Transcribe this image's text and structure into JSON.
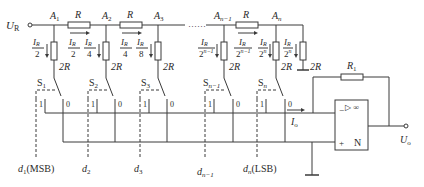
{
  "diagram": {
    "type": "R-2R ladder D/A converter",
    "reference_voltage_label": "U",
    "reference_voltage_sub": "R",
    "output_voltage_label": "U",
    "output_voltage_sub": "o",
    "output_current_label": "I",
    "output_current_sub": "o",
    "ellipsis": "……",
    "nodes": [
      {
        "label": "A",
        "sub": "1"
      },
      {
        "label": "A",
        "sub": "2"
      },
      {
        "label": "A",
        "sub": "3"
      },
      {
        "label": "A",
        "sub": "n−1"
      },
      {
        "label": "A",
        "sub": "n"
      }
    ],
    "series_resistor_label": "R",
    "shunt_resistor_label": "2R",
    "feedback_resistor_label": "R",
    "feedback_resistor_sub": "1",
    "branch_currents": [
      {
        "num": "I",
        "num_sub": "R",
        "den": "2"
      },
      {
        "num": "I",
        "num_sub": "R",
        "den": "4"
      },
      {
        "num": "I",
        "num_sub": "R",
        "den": "8"
      },
      {
        "num": "I",
        "num_sub": "R",
        "den": "2",
        "den_sup": "n−1"
      },
      {
        "num": "I",
        "num_sub": "R",
        "den": "2",
        "den_sup": "n"
      },
      {
        "num": "I",
        "num_sub": "R",
        "den": "2",
        "den_sup": "n"
      }
    ],
    "series_currents": [
      {
        "num": "I",
        "num_sub": "R",
        "den": "2"
      },
      {
        "num": "I",
        "num_sub": "R",
        "den": "4"
      },
      {
        "num": "I",
        "num_sub": "R",
        "den": "2",
        "den_sup": "n−1"
      }
    ],
    "switches": [
      {
        "label": "S",
        "sub": "1"
      },
      {
        "label": "S",
        "sub": "2"
      },
      {
        "label": "S",
        "sub": "3"
      },
      {
        "label": "S",
        "sub": "n−1"
      },
      {
        "label": "S",
        "sub": "n"
      }
    ],
    "switch_contact_one": "1",
    "switch_contact_zero": "0",
    "digital_inputs": [
      {
        "label": "d",
        "sub": "1",
        "suffix": "(MSB)"
      },
      {
        "label": "d",
        "sub": "2",
        "suffix": ""
      },
      {
        "label": "d",
        "sub": "3",
        "suffix": ""
      },
      {
        "label": "d",
        "sub": "n−1",
        "suffix": ""
      },
      {
        "label": "d",
        "sub": "n",
        "suffix": "(LSB)"
      }
    ],
    "opamp": {
      "symbol": "▷ ∞",
      "label": "N",
      "inverting": "−",
      "noninverting": "+"
    }
  }
}
